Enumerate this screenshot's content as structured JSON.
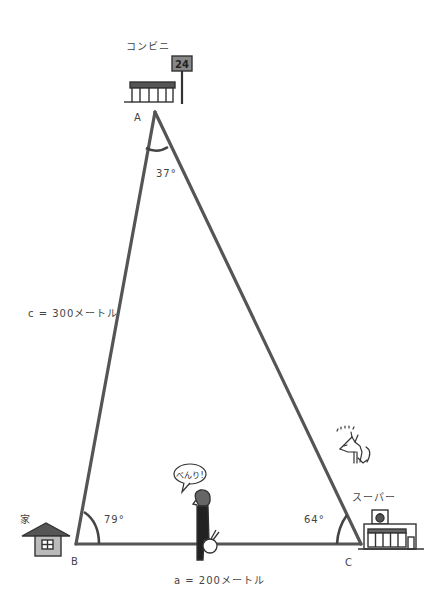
{
  "diagram": {
    "line_color": "#555555",
    "vertices": {
      "A": {
        "label": "A",
        "place": "コンビニ",
        "angle": "37°",
        "x": 155,
        "y": 112
      },
      "B": {
        "label": "B",
        "place": "家",
        "angle": "79°",
        "x": 76,
        "y": 544
      },
      "C": {
        "label": "C",
        "place": "スーパー",
        "angle": "64°",
        "x": 361,
        "y": 544
      }
    },
    "sides": {
      "c": {
        "label": "c = 300メートル",
        "between": [
          "A",
          "B"
        ]
      },
      "a": {
        "label": "a = 200メートル",
        "between": [
          "B",
          "C"
        ]
      }
    },
    "sign_text": "24",
    "speech_bubble": "べんり!"
  }
}
